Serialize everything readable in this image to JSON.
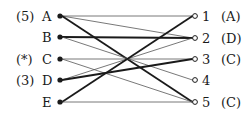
{
  "diagram": {
    "type": "bipartite-matching",
    "colors": {
      "ink": "#1a1a1a",
      "thin_line": "#555555",
      "thick_line": "#1a1a1a",
      "background": "#ffffff"
    },
    "left_nodes": [
      {
        "id": "A",
        "label": "A",
        "prefix": "(5)",
        "x": 60,
        "y": 16
      },
      {
        "id": "B",
        "label": "B",
        "prefix": "",
        "x": 60,
        "y": 37
      },
      {
        "id": "C",
        "label": "C",
        "prefix": "(*)",
        "x": 60,
        "y": 59
      },
      {
        "id": "D",
        "label": "D",
        "prefix": "(3)",
        "x": 60,
        "y": 80
      },
      {
        "id": "E",
        "label": "E",
        "prefix": "",
        "x": 60,
        "y": 102
      }
    ],
    "right_nodes": [
      {
        "id": "1",
        "label": "1",
        "suffix": "(A)",
        "x": 195,
        "y": 16
      },
      {
        "id": "2",
        "label": "2",
        "suffix": "(D)",
        "x": 195,
        "y": 38
      },
      {
        "id": "3",
        "label": "3",
        "suffix": "(C)",
        "x": 195,
        "y": 59
      },
      {
        "id": "4",
        "label": "4",
        "suffix": "",
        "x": 195,
        "y": 80
      },
      {
        "id": "5",
        "label": "5",
        "suffix": "(C)",
        "x": 195,
        "y": 102
      }
    ],
    "edges": [
      {
        "from": "A",
        "to": "1",
        "weight": "thin"
      },
      {
        "from": "A",
        "to": "2",
        "weight": "thin"
      },
      {
        "from": "A",
        "to": "5",
        "weight": "thick"
      },
      {
        "from": "B",
        "to": "2",
        "weight": "thick"
      },
      {
        "from": "B",
        "to": "4",
        "weight": "thin"
      },
      {
        "from": "C",
        "to": "3",
        "weight": "thin"
      },
      {
        "from": "C",
        "to": "5",
        "weight": "thin"
      },
      {
        "from": "D",
        "to": "2",
        "weight": "thin"
      },
      {
        "from": "D",
        "to": "3",
        "weight": "thick"
      },
      {
        "from": "E",
        "to": "1",
        "weight": "thick"
      },
      {
        "from": "E",
        "to": "5",
        "weight": "thin"
      }
    ]
  }
}
